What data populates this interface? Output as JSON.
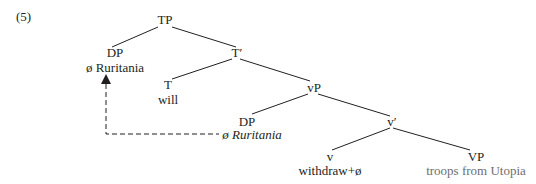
{
  "example_number": "(5)",
  "tree": {
    "TP": "TP",
    "DP_spec": "DP",
    "DP_spec_text": "ø Ruritania",
    "T_bar": "T′",
    "T": "T",
    "T_text": "will",
    "vP": "vP",
    "DP_inner": "DP",
    "DP_inner_text": "ø Ruritania",
    "v_bar": "v′",
    "v": "v",
    "v_text": "withdraw+ø",
    "VP": "VP",
    "VP_text": "troops from Utopia"
  },
  "colors": {
    "line": "#231f20",
    "gray_text": "#6d6e71"
  }
}
